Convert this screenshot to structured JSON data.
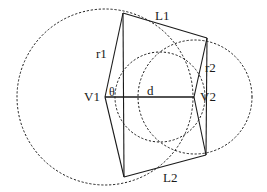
{
  "figure": {
    "width": 267,
    "height": 192,
    "background_color": "#ffffff",
    "stroke_color": "#1a1a1a"
  },
  "labels": {
    "top_edge": "L1",
    "radius_left": "r1",
    "radius_right": "r2",
    "vertex_left": "V1",
    "vertex_right": "V2",
    "angle": "θ",
    "distance": "d",
    "bottom_edge": "L2"
  },
  "chart_data": {
    "type": "diagram",
    "title": "",
    "xlabel": "",
    "ylabel": "",
    "grid": false,
    "legend_position": "none",
    "xlim": [
      0,
      267
    ],
    "ylim": [
      0,
      192
    ],
    "circles": [
      {
        "name": "circle-left",
        "label": "r1",
        "center": [
          105,
          97
        ],
        "radius": 88,
        "style": "dashed"
      },
      {
        "name": "circle-right",
        "label": "r2",
        "center": [
          195,
          97
        ],
        "radius": 57,
        "style": "dashed"
      },
      {
        "name": "circle-inner",
        "label": "",
        "center": [
          160,
          97
        ],
        "radius": 45,
        "style": "dashed"
      }
    ],
    "quadrilateral": {
      "name": "quadrilateral",
      "style": "solid",
      "vertices": [
        [
          123,
          13
        ],
        [
          207,
          38
        ],
        [
          206,
          155
        ],
        [
          124,
          177
        ]
      ],
      "edges": [
        {
          "name": "L1",
          "from": [
            123,
            13
          ],
          "to": [
            207,
            38
          ]
        },
        {
          "name": "r2-edge",
          "from": [
            207,
            38
          ],
          "to": [
            206,
            155
          ]
        },
        {
          "name": "L2",
          "from": [
            206,
            155
          ],
          "to": [
            124,
            177
          ]
        },
        {
          "name": "r1-edge",
          "from": [
            124,
            177
          ],
          "to": [
            123,
            13
          ]
        }
      ]
    },
    "points": [
      {
        "name": "V1",
        "label": "V1",
        "coords": [
          105,
          97
        ]
      },
      {
        "name": "V2",
        "label": "V2",
        "coords": [
          194,
          97
        ]
      }
    ],
    "segments": [
      {
        "name": "d",
        "label": "d",
        "from": [
          105,
          97
        ],
        "to": [
          194,
          97
        ],
        "style": "solid"
      },
      {
        "name": "r1-upper",
        "label": "r1",
        "from": [
          105,
          97
        ],
        "to": [
          123,
          13
        ],
        "style": "solid"
      },
      {
        "name": "r1-lower",
        "label": "",
        "from": [
          105,
          97
        ],
        "to": [
          124,
          177
        ],
        "style": "solid"
      },
      {
        "name": "r2-upper",
        "label": "r2",
        "from": [
          194,
          97
        ],
        "to": [
          207,
          38
        ],
        "style": "solid"
      },
      {
        "name": "r2-lower",
        "label": "",
        "from": [
          194,
          97
        ],
        "to": [
          206,
          155
        ],
        "style": "solid"
      }
    ],
    "angles": [
      {
        "name": "theta",
        "label": "θ",
        "at": [
          105,
          97
        ],
        "between": [
          "d",
          "r1-upper"
        ]
      }
    ]
  }
}
